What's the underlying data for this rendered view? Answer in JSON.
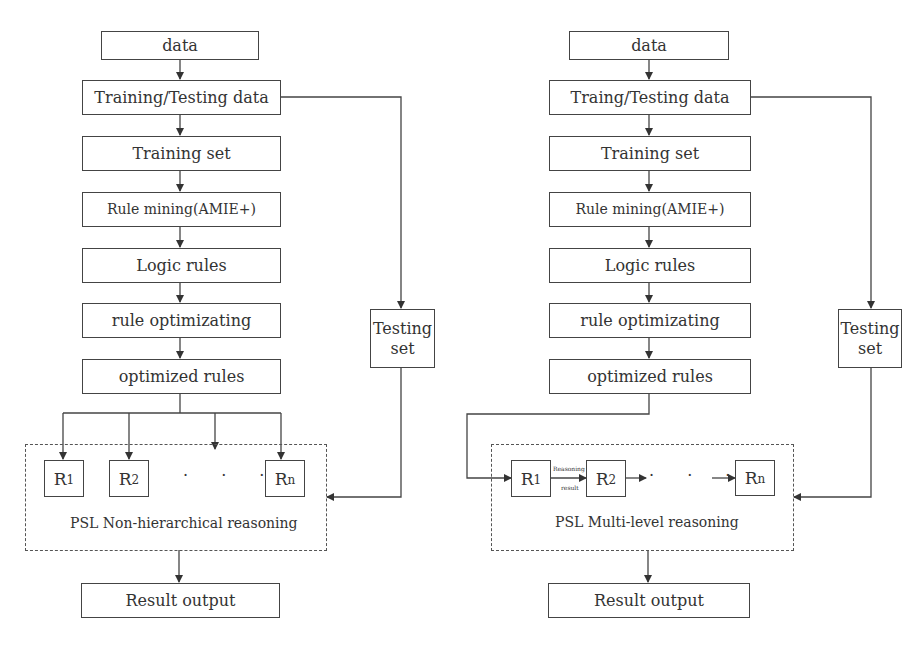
{
  "left": {
    "title": "Non-hierarchical flow",
    "nodes": {
      "data": "data",
      "train_test": "Training/Testing  data",
      "training_set": "Training set",
      "rule_mining": "Rule mining(AMIE+)",
      "logic_rules": "Logic rules",
      "rule_opt": "rule optimizating",
      "optimized": "optimized rules",
      "testing_set": "Testing set",
      "result": "Result output"
    },
    "rules": [
      {
        "main": "R",
        "sub": "1"
      },
      {
        "main": "R",
        "sub": "2"
      },
      {
        "main": "R",
        "sub": "n"
      }
    ],
    "ellipsis": "· · ·",
    "group_label": "PSL Non-hierarchical reasoning"
  },
  "right": {
    "title": "Multi-level flow",
    "nodes": {
      "data": "data",
      "train_test": "Traing/Testing  data",
      "training_set": "Training  set",
      "rule_mining": "Rule mining(AMIE+)",
      "logic_rules": "Logic rules",
      "rule_opt": "rule optimizating",
      "optimized": "optimized rules",
      "testing_set": "Testing set",
      "result": "Result output"
    },
    "rules": [
      {
        "main": "R",
        "sub": "1"
      },
      {
        "main": "R",
        "sub": "2"
      },
      {
        "main": "R",
        "sub": "n"
      }
    ],
    "edge_label_top": "Reasoning",
    "edge_label_bottom": "result",
    "ellipsis": "· · ·",
    "group_label": "PSL Multi-level reasoning"
  },
  "colors": {
    "stroke": "#444444",
    "text": "#333333",
    "background": "#ffffff"
  }
}
